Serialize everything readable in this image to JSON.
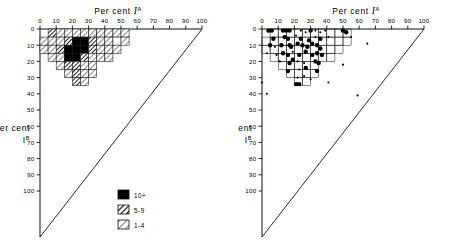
{
  "figure": {
    "x_axis_label_prefix": "Per cent",
    "x_axis_label_symbol": "I",
    "x_axis_label_sup": "A",
    "y_axis_label_prefix": "Per cent",
    "y_axis_label_symbol": "I",
    "y_axis_label_sup": "B",
    "tick_labels": [
      "0",
      "10",
      "20",
      "30",
      "40",
      "50",
      "60",
      "70",
      "80",
      "90",
      "100"
    ],
    "ink_color": "#111111",
    "fill_color": "#000000",
    "background_color": "#ffffff"
  },
  "legend": {
    "items": [
      {
        "label": "10+",
        "pattern": "solid"
      },
      {
        "label": "5-9",
        "pattern": "coarse-hatch"
      },
      {
        "label": "1-4",
        "pattern": "fine-hatch"
      }
    ]
  },
  "chart_data": [
    {
      "type": "heatmap",
      "title": "Density of I-A vs I-B percentages (binned)",
      "xlabel": "Per cent I^A",
      "ylabel": "Per cent I^B",
      "xlim": [
        0,
        100
      ],
      "ylim": [
        0,
        100
      ],
      "y_axis_inverted": true,
      "grid": true,
      "bin_size": 5,
      "legend_position": "bottom-center",
      "legend_entries": [
        "10+",
        "5-9",
        "1-4"
      ],
      "cells": [
        {
          "x": 5,
          "y": 0,
          "count_class": "5-9"
        },
        {
          "x": 10,
          "y": 0,
          "count_class": "1-4"
        },
        {
          "x": 15,
          "y": 0,
          "count_class": "1-4"
        },
        {
          "x": 20,
          "y": 0,
          "count_class": "1-4"
        },
        {
          "x": 25,
          "y": 0,
          "count_class": "1-4"
        },
        {
          "x": 30,
          "y": 0,
          "count_class": "1-4"
        },
        {
          "x": 35,
          "y": 0,
          "count_class": "1-4"
        },
        {
          "x": 40,
          "y": 0,
          "count_class": "1-4"
        },
        {
          "x": 45,
          "y": 0,
          "count_class": "1-4"
        },
        {
          "x": 50,
          "y": 0,
          "count_class": "1-4"
        },
        {
          "x": 0,
          "y": 5,
          "count_class": "1-4"
        },
        {
          "x": 5,
          "y": 5,
          "count_class": "1-4"
        },
        {
          "x": 10,
          "y": 5,
          "count_class": "1-4"
        },
        {
          "x": 15,
          "y": 5,
          "count_class": "5-9"
        },
        {
          "x": 20,
          "y": 5,
          "count_class": "10+"
        },
        {
          "x": 25,
          "y": 5,
          "count_class": "10+"
        },
        {
          "x": 30,
          "y": 5,
          "count_class": "5-9"
        },
        {
          "x": 35,
          "y": 5,
          "count_class": "1-4"
        },
        {
          "x": 40,
          "y": 5,
          "count_class": "1-4"
        },
        {
          "x": 45,
          "y": 5,
          "count_class": "none"
        },
        {
          "x": 50,
          "y": 5,
          "count_class": "1-4"
        },
        {
          "x": 0,
          "y": 10,
          "count_class": "1-4"
        },
        {
          "x": 5,
          "y": 10,
          "count_class": "1-4"
        },
        {
          "x": 10,
          "y": 10,
          "count_class": "5-9"
        },
        {
          "x": 15,
          "y": 10,
          "count_class": "10+"
        },
        {
          "x": 20,
          "y": 10,
          "count_class": "10+"
        },
        {
          "x": 25,
          "y": 10,
          "count_class": "10+"
        },
        {
          "x": 30,
          "y": 10,
          "count_class": "5-9"
        },
        {
          "x": 35,
          "y": 10,
          "count_class": "1-4"
        },
        {
          "x": 40,
          "y": 10,
          "count_class": "1-4"
        },
        {
          "x": 45,
          "y": 10,
          "count_class": "1-4"
        },
        {
          "x": 5,
          "y": 15,
          "count_class": "1-4"
        },
        {
          "x": 10,
          "y": 15,
          "count_class": "1-4"
        },
        {
          "x": 15,
          "y": 15,
          "count_class": "10+"
        },
        {
          "x": 20,
          "y": 15,
          "count_class": "10+"
        },
        {
          "x": 25,
          "y": 15,
          "count_class": "5-9"
        },
        {
          "x": 30,
          "y": 15,
          "count_class": "1-4"
        },
        {
          "x": 35,
          "y": 15,
          "count_class": "1-4"
        },
        {
          "x": 40,
          "y": 15,
          "count_class": "1-4"
        },
        {
          "x": 10,
          "y": 20,
          "count_class": "1-4"
        },
        {
          "x": 15,
          "y": 20,
          "count_class": "5-9"
        },
        {
          "x": 20,
          "y": 20,
          "count_class": "5-9"
        },
        {
          "x": 25,
          "y": 20,
          "count_class": "1-4"
        },
        {
          "x": 30,
          "y": 20,
          "count_class": "1-4"
        },
        {
          "x": 15,
          "y": 25,
          "count_class": "1-4"
        },
        {
          "x": 20,
          "y": 25,
          "count_class": "5-9"
        },
        {
          "x": 25,
          "y": 25,
          "count_class": "1-4"
        },
        {
          "x": 30,
          "y": 25,
          "count_class": "1-4"
        },
        {
          "x": 20,
          "y": 30,
          "count_class": "5-9"
        },
        {
          "x": 25,
          "y": 30,
          "count_class": "1-4"
        }
      ]
    },
    {
      "type": "scatter",
      "title": "Individual observations of I-A vs I-B percentages",
      "xlabel": "Per cent I^A",
      "ylabel": "Per cent I^B",
      "xlim": [
        0,
        100
      ],
      "ylim": [
        0,
        100
      ],
      "y_axis_inverted": true,
      "grid": true,
      "bin_size": 5,
      "points": [
        {
          "x": 4,
          "y": 1,
          "size": "large"
        },
        {
          "x": 6,
          "y": 1,
          "size": "large"
        },
        {
          "x": 13,
          "y": 1,
          "size": "large"
        },
        {
          "x": 15,
          "y": 1,
          "size": "large"
        },
        {
          "x": 17,
          "y": 1,
          "size": "large"
        },
        {
          "x": 24,
          "y": 1,
          "size": "small"
        },
        {
          "x": 27,
          "y": 2,
          "size": "small"
        },
        {
          "x": 30,
          "y": 1,
          "size": "large"
        },
        {
          "x": 33,
          "y": 1,
          "size": "small"
        },
        {
          "x": 36,
          "y": 2,
          "size": "small"
        },
        {
          "x": 39,
          "y": 1,
          "size": "small"
        },
        {
          "x": 50,
          "y": 1,
          "size": "large"
        },
        {
          "x": 52,
          "y": 2,
          "size": "large"
        },
        {
          "x": 7,
          "y": 6,
          "size": "large"
        },
        {
          "x": 14,
          "y": 5,
          "size": "large"
        },
        {
          "x": 16,
          "y": 6,
          "size": "large"
        },
        {
          "x": 21,
          "y": 4,
          "size": "small"
        },
        {
          "x": 24,
          "y": 6,
          "size": "large"
        },
        {
          "x": 29,
          "y": 7,
          "size": "large"
        },
        {
          "x": 33,
          "y": 5,
          "size": "small"
        },
        {
          "x": 36,
          "y": 6,
          "size": "large"
        },
        {
          "x": 41,
          "y": 5,
          "size": "small"
        },
        {
          "x": 55,
          "y": 5,
          "size": "small"
        },
        {
          "x": 5,
          "y": 10,
          "size": "large"
        },
        {
          "x": 8,
          "y": 11,
          "size": "small"
        },
        {
          "x": 12,
          "y": 10,
          "size": "large"
        },
        {
          "x": 17,
          "y": 10,
          "size": "large"
        },
        {
          "x": 18,
          "y": 11,
          "size": "large"
        },
        {
          "x": 22,
          "y": 9,
          "size": "large"
        },
        {
          "x": 25,
          "y": 10,
          "size": "large"
        },
        {
          "x": 28,
          "y": 11,
          "size": "large"
        },
        {
          "x": 31,
          "y": 9,
          "size": "large"
        },
        {
          "x": 34,
          "y": 10,
          "size": "large"
        },
        {
          "x": 36,
          "y": 12,
          "size": "large"
        },
        {
          "x": 65,
          "y": 9,
          "size": "small"
        },
        {
          "x": 3,
          "y": 15,
          "size": "small"
        },
        {
          "x": 9,
          "y": 16,
          "size": "small"
        },
        {
          "x": 13,
          "y": 15,
          "size": "large"
        },
        {
          "x": 16,
          "y": 16,
          "size": "large"
        },
        {
          "x": 19,
          "y": 14,
          "size": "small"
        },
        {
          "x": 23,
          "y": 16,
          "size": "large"
        },
        {
          "x": 27,
          "y": 14,
          "size": "large"
        },
        {
          "x": 31,
          "y": 16,
          "size": "large"
        },
        {
          "x": 34,
          "y": 15,
          "size": "large"
        },
        {
          "x": 37,
          "y": 16,
          "size": "large"
        },
        {
          "x": 11,
          "y": 20,
          "size": "small"
        },
        {
          "x": 17,
          "y": 21,
          "size": "large"
        },
        {
          "x": 19,
          "y": 19,
          "size": "large"
        },
        {
          "x": 22,
          "y": 20,
          "size": "small"
        },
        {
          "x": 26,
          "y": 21,
          "size": "small"
        },
        {
          "x": 33,
          "y": 20,
          "size": "large"
        },
        {
          "x": 35,
          "y": 21,
          "size": "large"
        },
        {
          "x": 50,
          "y": 22,
          "size": "small"
        },
        {
          "x": 16,
          "y": 26,
          "size": "large"
        },
        {
          "x": 23,
          "y": 25,
          "size": "small"
        },
        {
          "x": 27,
          "y": 24,
          "size": "large"
        },
        {
          "x": 34,
          "y": 26,
          "size": "large"
        },
        {
          "x": 22,
          "y": 30,
          "size": "small"
        },
        {
          "x": 26,
          "y": 29,
          "size": "small"
        },
        {
          "x": 30,
          "y": 31,
          "size": "small"
        },
        {
          "x": 21,
          "y": 34,
          "size": "large"
        },
        {
          "x": 23,
          "y": 34,
          "size": "large"
        },
        {
          "x": 41,
          "y": 33,
          "size": "small"
        },
        {
          "x": 0,
          "y": 33,
          "size": "small"
        },
        {
          "x": 3,
          "y": 40,
          "size": "small"
        },
        {
          "x": 59,
          "y": 41,
          "size": "small"
        }
      ]
    }
  ]
}
